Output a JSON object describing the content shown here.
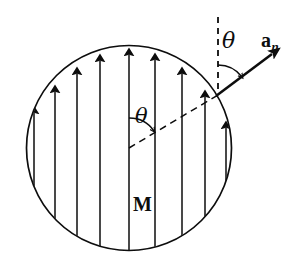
{
  "figure": {
    "background_color": "#ffffff",
    "stroke_color": "#0d0d0d",
    "width": 305,
    "height": 275
  },
  "labels": {
    "magnetization": "M",
    "theta_center": "θ",
    "theta_surface": "θ",
    "normal_vector_base": "a",
    "normal_vector_subscript": "n"
  },
  "geometry": {
    "circle": {
      "cx": 129,
      "cy": 148,
      "r": 103,
      "stroke_width": 1.6
    },
    "surface_point": {
      "x": 218,
      "y": 95
    },
    "center_point": {
      "x": 129,
      "y": 148
    },
    "dashed_vertical_top": {
      "x": 218,
      "y": 17
    },
    "normal_arrow_tip": {
      "x": 276,
      "y": 52
    },
    "magnetization_lines_x": [
      34,
      55,
      77,
      100,
      129,
      155,
      182,
      205,
      226
    ],
    "arrow_count": 9,
    "theta_center_arc_radius": 30,
    "theta_surface_arc_radius": 30
  },
  "label_positions": {
    "magnetization": {
      "left": 133,
      "top": 196
    },
    "theta_center": {
      "left": 135,
      "top": 108
    },
    "theta_surface": {
      "left": 222,
      "top": 32
    },
    "normal_vector": {
      "left": 262,
      "top": 32
    }
  }
}
